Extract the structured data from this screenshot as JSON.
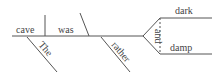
{
  "diagram": {
    "type": "sentence-diagram",
    "sentence": "The cave was rather dark and damp",
    "subject": "cave",
    "verb": "was",
    "modifiers": {
      "article": "The",
      "adverb": "rather"
    },
    "predicate_adjectives": [
      "dark",
      "damp"
    ],
    "conjunction": "and",
    "colors": {
      "line": "#555555",
      "text": "#444444",
      "background": "#ffffff"
    }
  }
}
